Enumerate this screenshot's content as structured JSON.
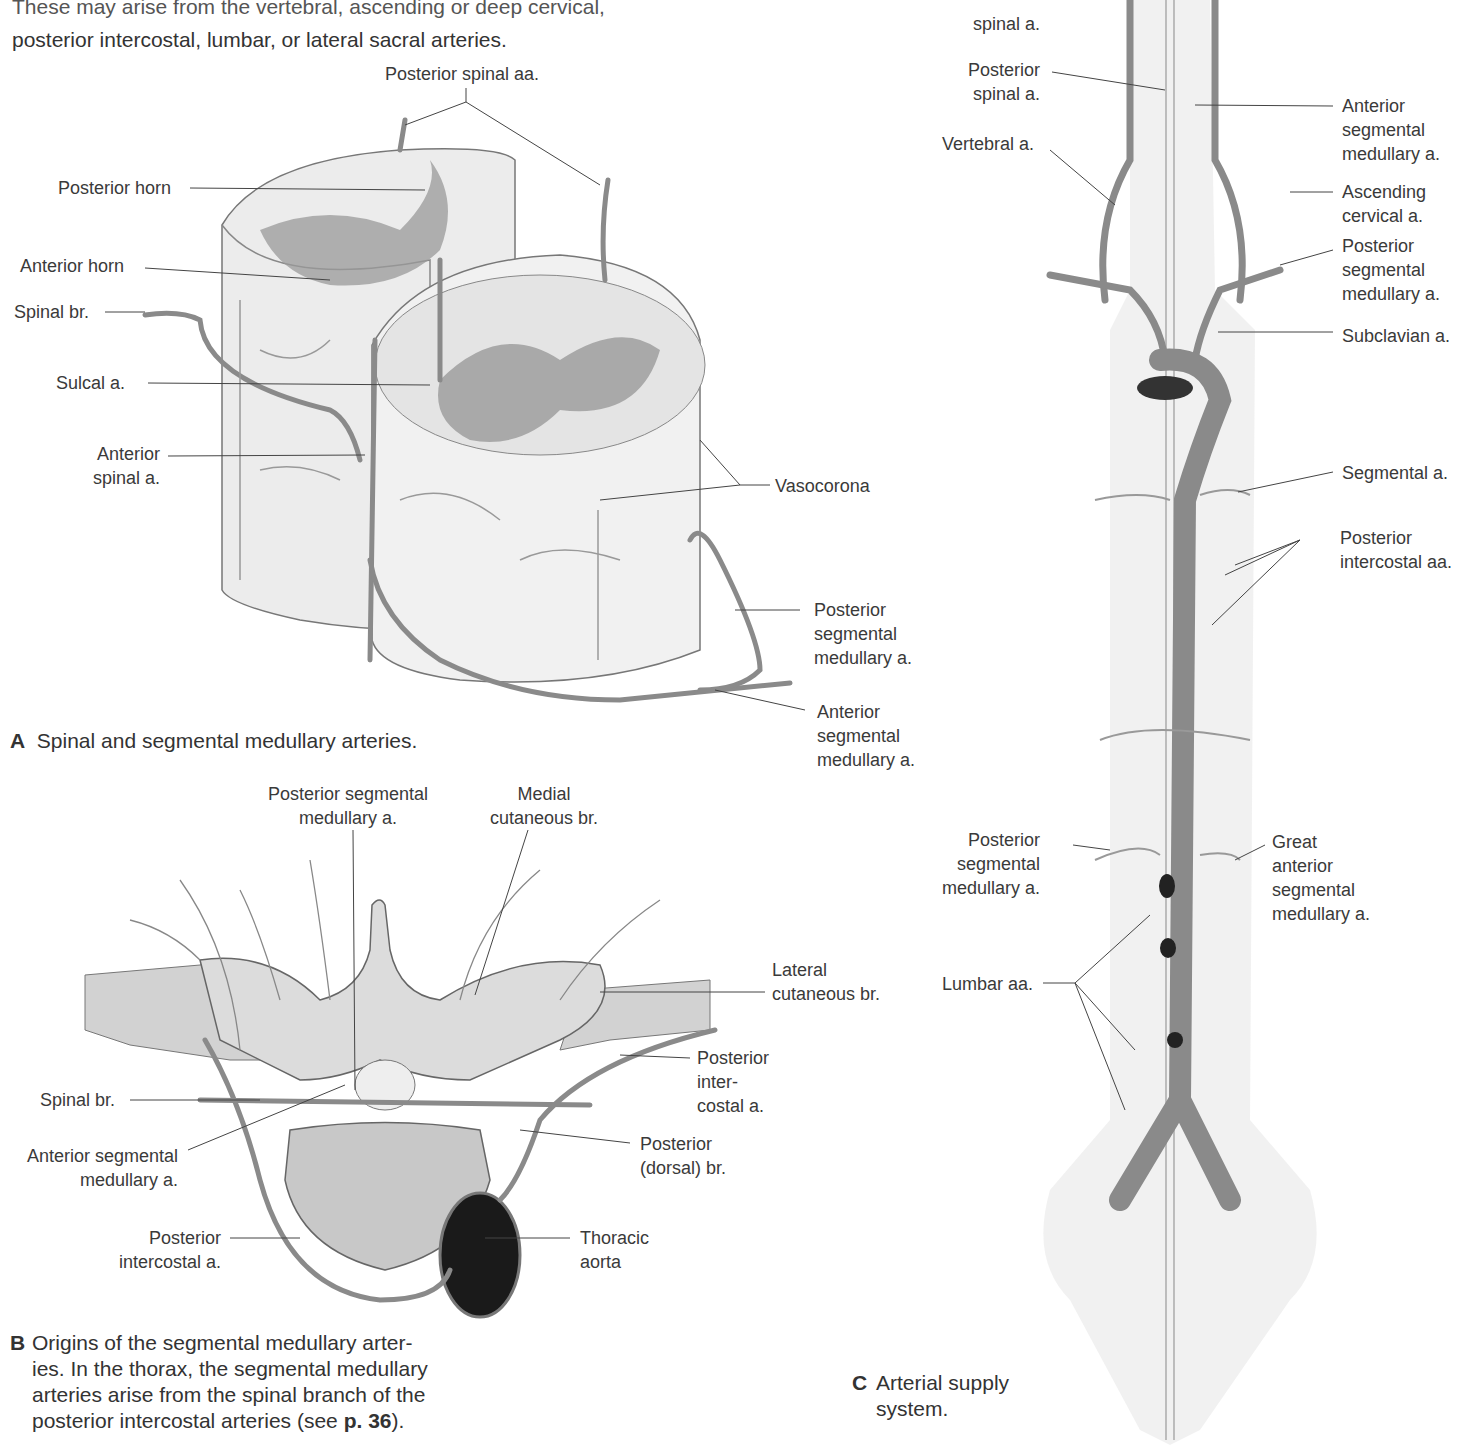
{
  "intro": {
    "line1": "These may arise from the vertebral, ascending or deep cervical,",
    "line2": "posterior intercostal, lumbar, or lateral sacral arteries."
  },
  "figureA": {
    "caption_letter": "A",
    "caption": "Spinal and segmental medullary arteries.",
    "labels": {
      "posterior_spinal_aa": "Posterior spinal aa.",
      "posterior_horn": "Posterior horn",
      "anterior_horn": "Anterior horn",
      "spinal_br": "Spinal br.",
      "sulcal_a": "Sulcal a.",
      "anterior_spinal_a": "Anterior\nspinal a.",
      "vasocorona": "Vasocorona",
      "posterior_segmental_medullary_a": "Posterior\nsegmental\nmedullary a.",
      "anterior_segmental_medullary_a": "Anterior\nsegmental\nmedullary a."
    }
  },
  "figureB": {
    "caption_letter": "B",
    "caption_lines": [
      "Origins of the segmental medullary arter-",
      "ies. In the thorax, the segmental medullary",
      "arteries arise from the spinal branch of the",
      "posterior intercostal arteries (see "
    ],
    "page_ref": "p. 36",
    "caption_end": ").",
    "labels": {
      "posterior_segmental_medullary_a": "Posterior segmental\nmedullary a.",
      "medial_cutaneous_br": "Medial\ncutaneous br.",
      "lateral_cutaneous_br": "Lateral\ncutaneous br.",
      "posterior_intercostal_a_right": "Posterior\ninter-\ncostal a.",
      "spinal_br": "Spinal br.",
      "anterior_segmental_medullary_a": "Anterior segmental\nmedullary a.",
      "posterior_dorsal_br": "Posterior\n(dorsal) br.",
      "posterior_intercostal_a_left": "Posterior\nintercostal a.",
      "thoracic_aorta": "Thoracic\naorta"
    }
  },
  "figureC": {
    "caption_letter": "C",
    "caption_lines": [
      "Arterial supply",
      "system."
    ],
    "labels": {
      "anterior_spinal_a": "spinal a.",
      "posterior_spinal_a": "Posterior\nspinal a.",
      "vertebral_a": "Vertebral a.",
      "anterior_segmental_medullary_a": "Anterior\nsegmental\nmedullary a.",
      "ascending_cervical_a": "Ascending\ncervical a.",
      "posterior_segmental_medullary_a_top": "Posterior\nsegmental\nmedullary a.",
      "subclavian_a": "Subclavian a.",
      "segmental_a": "Segmental a.",
      "posterior_intercostal_aa": "Posterior\nintercostal aa.",
      "posterior_segmental_medullary_a_bottom": "Posterior\nsegmental\nmedullary a.",
      "great_anterior_segmental_medullary_a": "Great\nanterior\nsegmental\nmedullary a.",
      "lumbar_aa": "Lumbar aa."
    }
  },
  "colors": {
    "artery": "#8a8a8a",
    "artery_dark": "#5a5a5a",
    "tissue": "#ececec",
    "grey_matter": "#9a9a9a",
    "bone": "#d8d8d8",
    "leader": "#444444"
  }
}
